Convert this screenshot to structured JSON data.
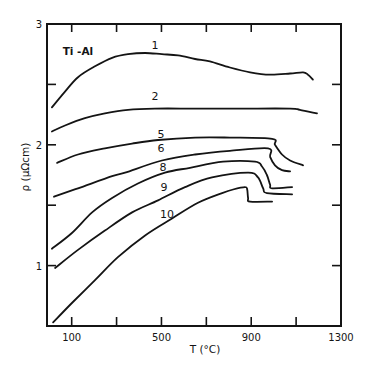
{
  "chart_data": {
    "type": "line",
    "title": "",
    "annotation": {
      "text": "Ti -Al",
      "at": [
        128,
        2.78
      ]
    },
    "xlabel": "T (°C)",
    "ylabel": "ρ (μΩcm)",
    "xlim": [
      -10,
      1300
    ],
    "ylim": [
      0.5,
      3.0
    ],
    "grid": false,
    "legend_position": "none (curves labeled inline)",
    "x_ticks": [
      100,
      300,
      500,
      700,
      900,
      1100
    ],
    "x_tick_labels": [
      {
        "value": 100,
        "label": "100"
      },
      {
        "value": 500,
        "label": "500"
      },
      {
        "value": 900,
        "label": "900"
      },
      {
        "value": 1300,
        "label": "1300"
      }
    ],
    "y_ticks": [
      1,
      1.5,
      2,
      2.5
    ],
    "y_tick_labels": [
      {
        "value": 1,
        "label": "1"
      },
      {
        "value": 2,
        "label": "2"
      },
      {
        "value": 3,
        "label": "3"
      }
    ],
    "series": [
      {
        "name": "1",
        "label_at": [
          471,
          2.83
        ],
        "points": [
          [
            12,
            2.31
          ],
          [
            70,
            2.44
          ],
          [
            128,
            2.56
          ],
          [
            204,
            2.65
          ],
          [
            280,
            2.72
          ],
          [
            351,
            2.75
          ],
          [
            427,
            2.76
          ],
          [
            502,
            2.75
          ],
          [
            574,
            2.74
          ],
          [
            650,
            2.71
          ],
          [
            716,
            2.69
          ],
          [
            805,
            2.64
          ],
          [
            895,
            2.6
          ],
          [
            984,
            2.58
          ],
          [
            1073,
            2.59
          ],
          [
            1131,
            2.6
          ],
          [
            1153,
            2.58
          ],
          [
            1175,
            2.54
          ]
        ]
      },
      {
        "name": "2",
        "label_at": [
          471,
          2.4
        ],
        "points": [
          [
            12,
            2.11
          ],
          [
            70,
            2.16
          ],
          [
            159,
            2.22
          ],
          [
            248,
            2.26
          ],
          [
            351,
            2.29
          ],
          [
            471,
            2.3
          ],
          [
            650,
            2.3
          ],
          [
            850,
            2.3
          ],
          [
            1073,
            2.3
          ],
          [
            1117,
            2.29
          ],
          [
            1193,
            2.26
          ]
        ]
      },
      {
        "name": "5",
        "label_at": [
          498,
          2.09
        ],
        "points": [
          [
            35,
            1.85
          ],
          [
            128,
            1.92
          ],
          [
            248,
            1.97
          ],
          [
            369,
            2.01
          ],
          [
            485,
            2.04
          ],
          [
            650,
            2.06
          ],
          [
            805,
            2.06
          ],
          [
            993,
            2.05
          ],
          [
            1006,
            2.0
          ],
          [
            1037,
            1.92
          ],
          [
            1073,
            1.87
          ],
          [
            1131,
            1.83
          ]
        ]
      },
      {
        "name": "6",
        "label_at": [
          498,
          1.97
        ],
        "points": [
          [
            21,
            1.57
          ],
          [
            128,
            1.64
          ],
          [
            280,
            1.74
          ],
          [
            338,
            1.77
          ],
          [
            502,
            1.87
          ],
          [
            650,
            1.92
          ],
          [
            805,
            1.95
          ],
          [
            975,
            1.97
          ],
          [
            984,
            1.9
          ],
          [
            1006,
            1.83
          ],
          [
            1037,
            1.79
          ],
          [
            1073,
            1.78
          ]
        ]
      },
      {
        "name": "8",
        "label_at": [
          507,
          1.82
        ],
        "points": [
          [
            12,
            1.14
          ],
          [
            101,
            1.27
          ],
          [
            191,
            1.44
          ],
          [
            280,
            1.56
          ],
          [
            395,
            1.68
          ],
          [
            516,
            1.77
          ],
          [
            627,
            1.81
          ],
          [
            774,
            1.86
          ],
          [
            917,
            1.86
          ],
          [
            948,
            1.82
          ],
          [
            970,
            1.75
          ],
          [
            984,
            1.67
          ],
          [
            993,
            1.64
          ],
          [
            1082,
            1.65
          ]
        ]
      },
      {
        "name": "9",
        "label_at": [
          511,
          1.65
        ],
        "points": [
          [
            26,
            0.98
          ],
          [
            128,
            1.13
          ],
          [
            248,
            1.29
          ],
          [
            369,
            1.44
          ],
          [
            485,
            1.54
          ],
          [
            605,
            1.65
          ],
          [
            725,
            1.73
          ],
          [
            886,
            1.77
          ],
          [
            930,
            1.73
          ],
          [
            953,
            1.64
          ],
          [
            970,
            1.6
          ],
          [
            1082,
            1.59
          ]
        ]
      },
      {
        "name": "10",
        "label_at": [
          525,
          1.43
        ],
        "points": [
          [
            17,
            0.53
          ],
          [
            101,
            0.69
          ],
          [
            204,
            0.88
          ],
          [
            306,
            1.07
          ],
          [
            427,
            1.25
          ],
          [
            547,
            1.39
          ],
          [
            663,
            1.52
          ],
          [
            770,
            1.6
          ],
          [
            819,
            1.63
          ],
          [
            872,
            1.65
          ],
          [
            882,
            1.63
          ],
          [
            886,
            1.56
          ],
          [
            895,
            1.53
          ],
          [
            993,
            1.53
          ]
        ]
      }
    ]
  }
}
